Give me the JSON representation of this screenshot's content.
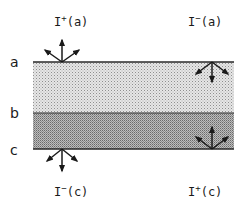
{
  "diagram": {
    "type": "two-layer radiative transfer schematic",
    "colors": {
      "background": "#ffffff",
      "line": "#2a2a2a",
      "upper_layer_fill": "#e4e4e4",
      "upper_layer_dot": "#9a9a9a",
      "lower_layer_fill": "#b4b4b4",
      "lower_layer_dot": "#6e6e6e",
      "arrow": "#1a1a1a"
    },
    "boundaries": [
      {
        "id": "a",
        "label": "a"
      },
      {
        "id": "b",
        "label": "b"
      },
      {
        "id": "c",
        "label": "c"
      }
    ],
    "layers": [
      {
        "name": "upper-layer",
        "from": "a",
        "to": "b",
        "shade": "light stipple"
      },
      {
        "name": "lower-layer",
        "from": "b",
        "to": "c",
        "shade": "dark stipple"
      }
    ],
    "fluxes": [
      {
        "id": "I_plus_a",
        "symbol": "I",
        "sign": "+",
        "arg": "(a)",
        "boundary": "a",
        "direction": "upward, exiting top"
      },
      {
        "id": "I_minus_a",
        "symbol": "I",
        "sign": "−",
        "arg": "(a)",
        "boundary": "a",
        "direction": "downward, entering top"
      },
      {
        "id": "I_minus_c",
        "symbol": "I",
        "sign": "−",
        "arg": "(c)",
        "boundary": "c",
        "direction": "downward, exiting bottom"
      },
      {
        "id": "I_plus_c",
        "symbol": "I",
        "sign": "+",
        "arg": "(c)",
        "boundary": "c",
        "direction": "upward, entering bottom"
      }
    ]
  }
}
